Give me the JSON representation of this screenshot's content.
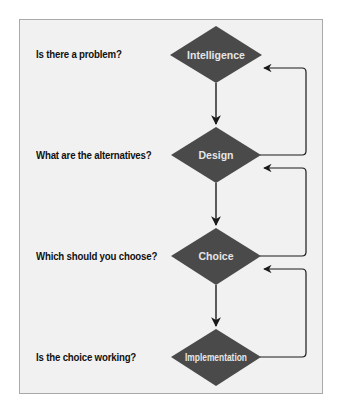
{
  "diagram": {
    "type": "flowchart",
    "colors": {
      "background": "#f1f1f1",
      "border": "#a9a9a9",
      "node_fill": "#4a4a4a",
      "node_text": "#e6e6e6",
      "arrow": "#1a1a1a",
      "question_text": "#111111"
    },
    "stages": [
      {
        "label": "Intelligence",
        "question": "Is there a problem?"
      },
      {
        "label": "Design",
        "question": "What are the alternatives?"
      },
      {
        "label": "Choice",
        "question": "Which should you choose?"
      },
      {
        "label": "Implementation",
        "question": "Is the choice working?"
      }
    ],
    "edges": [
      {
        "from": "Intelligence",
        "to": "Design",
        "kind": "forward"
      },
      {
        "from": "Design",
        "to": "Choice",
        "kind": "forward"
      },
      {
        "from": "Choice",
        "to": "Implementation",
        "kind": "forward"
      },
      {
        "from": "Design",
        "to": "Intelligence",
        "kind": "feedback"
      },
      {
        "from": "Choice",
        "to": "Design",
        "kind": "feedback"
      },
      {
        "from": "Implementation",
        "to": "Choice",
        "kind": "feedback"
      }
    ]
  }
}
